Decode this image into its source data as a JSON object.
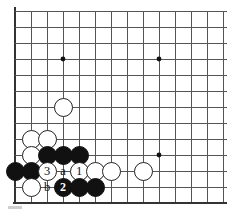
{
  "figure": {
    "kind": "go-board-diagram",
    "board": {
      "line_color": "#555555",
      "edge_color": "#333333",
      "background": "#ffffff",
      "cell_size": 16,
      "origin_x": 15,
      "origin_y": 11,
      "cols": 14,
      "rows": 13,
      "left_edge_col": 0,
      "bottom_edge_row": 12,
      "star_points": [
        {
          "col": 3,
          "row": 3
        },
        {
          "col": 9,
          "row": 3
        },
        {
          "col": 9,
          "row": 9
        }
      ]
    },
    "stones": [
      {
        "id": "w-corner-approach",
        "color": "white",
        "col": 3,
        "row": 6,
        "label": ""
      },
      {
        "id": "w-b2",
        "color": "white",
        "col": 1,
        "row": 8,
        "label": ""
      },
      {
        "id": "w-c2",
        "color": "white",
        "col": 2,
        "row": 8,
        "label": ""
      },
      {
        "id": "w-b3",
        "color": "white",
        "col": 1,
        "row": 9,
        "label": ""
      },
      {
        "id": "b-c3",
        "color": "black",
        "col": 2,
        "row": 9,
        "label": ""
      },
      {
        "id": "b-d3",
        "color": "black",
        "col": 3,
        "row": 9,
        "label": ""
      },
      {
        "id": "b-e3",
        "color": "black",
        "col": 4,
        "row": 9,
        "label": ""
      },
      {
        "id": "b-a4",
        "color": "black",
        "col": 0,
        "row": 10,
        "label": ""
      },
      {
        "id": "b-b4",
        "color": "black",
        "col": 1,
        "row": 10,
        "label": ""
      },
      {
        "id": "w-move-3",
        "color": "white",
        "col": 2,
        "row": 10,
        "label": "3"
      },
      {
        "id": "w-move-1",
        "color": "white",
        "col": 4,
        "row": 10,
        "label": "1"
      },
      {
        "id": "w-f4",
        "color": "white",
        "col": 5,
        "row": 10,
        "label": ""
      },
      {
        "id": "w-g4",
        "color": "white",
        "col": 6,
        "row": 10,
        "label": ""
      },
      {
        "id": "w-i4",
        "color": "white",
        "col": 8,
        "row": 10,
        "label": ""
      },
      {
        "id": "w-b5",
        "color": "white",
        "col": 1,
        "row": 11,
        "label": ""
      },
      {
        "id": "b-move-2",
        "color": "black",
        "col": 3,
        "row": 11,
        "label": "2"
      },
      {
        "id": "b-e5",
        "color": "black",
        "col": 4,
        "row": 11,
        "label": ""
      },
      {
        "id": "b-f5",
        "color": "black",
        "col": 5,
        "row": 11,
        "label": ""
      }
    ],
    "point_labels": [
      {
        "id": "label-a",
        "text": "a",
        "col": 3,
        "row": 10
      },
      {
        "id": "label-b",
        "text": "b",
        "col": 2,
        "row": 11
      }
    ]
  }
}
